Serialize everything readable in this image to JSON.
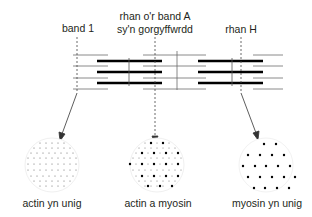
{
  "labels": {
    "band_1": "band 1",
    "band_a_line1": "rhan o'r band A",
    "band_a_line2": "sy'n gorgyffwrdd",
    "h_zone": "rhan H"
  },
  "cross_sections": [
    {
      "label": "actin yn unig",
      "type": "thin filaments only"
    },
    {
      "label": "actin a myosin",
      "type": "thin and thick filaments"
    },
    {
      "label": "myosin yn unig",
      "type": "thick filaments only"
    }
  ],
  "colors": {
    "thick_filament": "#000000",
    "thin_filament": "#8a8a8a",
    "text": "#231f20",
    "circle_outline": "#e6e6e6"
  }
}
